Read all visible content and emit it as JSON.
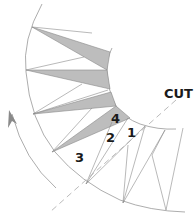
{
  "diagram": {
    "title": "",
    "labels": {
      "cut": "CUT",
      "step1": "1",
      "step2": "2",
      "step3": "3",
      "step4": "4"
    },
    "colors": {
      "background": "#ffffff",
      "line": "#8a8a8a",
      "shade": "#bdbdbd",
      "text": "#1a1a1a",
      "dash": "#a8a8a8"
    },
    "elements": {
      "outer_circle": "outer-arc",
      "inner_circle": "inner-arc",
      "shaded_wedges": 4,
      "direction_arrow": "counter-clockwise",
      "cut_line": "dashed"
    }
  }
}
